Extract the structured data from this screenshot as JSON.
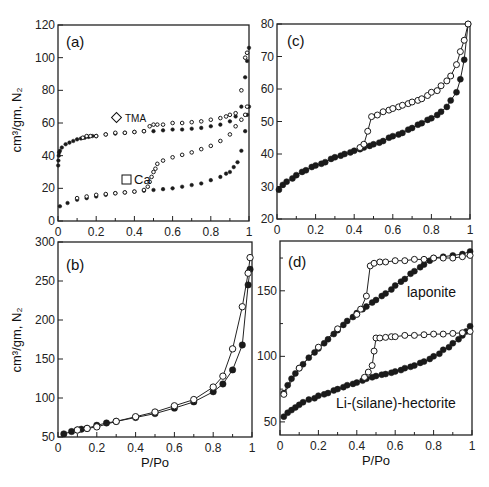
{
  "chart_data": [
    {
      "id": "a",
      "type": "scatter",
      "panel_label": "(a)",
      "xlabel": "",
      "ylabel": "cm3/gm, N2",
      "xlim": [
        0,
        1
      ],
      "ylim": [
        0,
        120
      ],
      "xticks": [
        0,
        0.2,
        0.4,
        0.6,
        0.8,
        1
      ],
      "xtick_labels": [
        "0",
        "0.2",
        "0.4",
        "0.6",
        "0.8",
        "1"
      ],
      "yticks": [
        0,
        20,
        40,
        60,
        80,
        100,
        120
      ],
      "ytick_labels": [
        "0",
        "20",
        "40",
        "60",
        "80",
        "100",
        "120"
      ],
      "annotations": [
        {
          "text": "TMA",
          "marker": "diamond",
          "x": 0.32,
          "y": 62
        },
        {
          "text": "Ca",
          "marker": "square",
          "x": 0.38,
          "y": 24
        }
      ],
      "series": [
        {
          "name": "TMA adsorption",
          "marker": "filled",
          "lines": false,
          "x": [
            0.001,
            0.002,
            0.004,
            0.006,
            0.01,
            0.02,
            0.04,
            0.06,
            0.08,
            0.1,
            0.12,
            0.14,
            0.16,
            0.18,
            0.2,
            0.25,
            0.3,
            0.35,
            0.4,
            0.45,
            0.5,
            0.55,
            0.6,
            0.65,
            0.7,
            0.75,
            0.8,
            0.85,
            0.9,
            0.93,
            0.96,
            0.98,
            0.99,
            1.0
          ],
          "y": [
            34,
            37,
            40,
            42,
            43,
            45,
            47,
            48,
            49,
            50,
            50.5,
            51,
            51.5,
            52,
            52,
            53,
            53.5,
            54,
            54.5,
            55,
            55,
            55.5,
            56,
            56,
            56.5,
            57,
            58,
            59,
            61,
            64,
            70,
            88,
            98,
            106
          ]
        },
        {
          "name": "TMA desorption",
          "marker": "open",
          "lines": false,
          "x": [
            0.13,
            0.15,
            0.17,
            0.2,
            0.25,
            0.3,
            0.35,
            0.4,
            0.45,
            0.48,
            0.5,
            0.52,
            0.55,
            0.6,
            0.65,
            0.7,
            0.75,
            0.8,
            0.85,
            0.88,
            0.9,
            0.93,
            0.96,
            0.98,
            0.99
          ],
          "y": [
            51,
            52,
            52,
            52,
            53,
            54,
            54,
            54.5,
            55,
            58,
            59,
            59,
            59,
            60,
            60,
            60.5,
            61,
            62,
            63,
            64,
            65,
            66,
            80,
            100,
            103
          ]
        },
        {
          "name": "Ca adsorption",
          "marker": "filled",
          "lines": false,
          "x": [
            0.01,
            0.05,
            0.1,
            0.15,
            0.2,
            0.25,
            0.3,
            0.35,
            0.4,
            0.45,
            0.5,
            0.55,
            0.6,
            0.65,
            0.7,
            0.75,
            0.8,
            0.85,
            0.88,
            0.9,
            0.92,
            0.94,
            0.96,
            0.98,
            0.99,
            1.0
          ],
          "y": [
            9,
            11,
            13,
            14,
            15,
            16,
            17,
            17.5,
            18,
            18.5,
            19,
            19.5,
            20,
            21,
            22,
            23,
            25,
            27,
            29,
            30,
            33,
            36,
            43,
            55,
            65,
            70
          ]
        },
        {
          "name": "Ca desorption",
          "marker": "open",
          "lines": false,
          "x": [
            0.1,
            0.15,
            0.2,
            0.25,
            0.3,
            0.35,
            0.4,
            0.45,
            0.47,
            0.48,
            0.49,
            0.5,
            0.51,
            0.52,
            0.55,
            0.6,
            0.65,
            0.7,
            0.75,
            0.8,
            0.85,
            0.9,
            0.93,
            0.96,
            0.98,
            0.99
          ],
          "y": [
            14,
            15,
            16,
            16.5,
            17,
            17.5,
            18,
            19,
            21,
            24,
            27,
            30,
            32,
            35,
            37,
            39,
            40.5,
            42,
            44,
            46,
            49,
            53,
            58,
            62,
            65,
            70
          ]
        }
      ]
    },
    {
      "id": "c",
      "type": "line",
      "panel_label": "(c)",
      "xlabel": "",
      "ylabel": "",
      "xlim": [
        0,
        1
      ],
      "ylim": [
        20,
        80
      ],
      "xticks": [
        0,
        0.2,
        0.4,
        0.6,
        0.8,
        1
      ],
      "xtick_labels": [
        "0",
        "0.2",
        "0.4",
        "0.6",
        "0.8",
        "1"
      ],
      "yticks": [
        20,
        30,
        40,
        50,
        60,
        70,
        80
      ],
      "ytick_labels": [
        "20",
        "30",
        "40",
        "50",
        "60",
        "70",
        "80"
      ],
      "series": [
        {
          "name": "adsorption",
          "marker": "filled",
          "lines": true,
          "x": [
            0.01,
            0.03,
            0.05,
            0.08,
            0.1,
            0.13,
            0.15,
            0.18,
            0.2,
            0.23,
            0.25,
            0.28,
            0.3,
            0.33,
            0.35,
            0.38,
            0.4,
            0.43,
            0.45,
            0.48,
            0.5,
            0.53,
            0.55,
            0.58,
            0.6,
            0.63,
            0.65,
            0.68,
            0.7,
            0.73,
            0.75,
            0.78,
            0.8,
            0.83,
            0.85,
            0.88,
            0.9,
            0.93,
            0.95,
            0.97,
            0.99
          ],
          "y": [
            29,
            30.5,
            31.5,
            32.5,
            33.5,
            34.5,
            35,
            36,
            36.5,
            37,
            37.5,
            38.5,
            39,
            39.5,
            40,
            40.5,
            41,
            41.5,
            42,
            42.5,
            43,
            43.5,
            44,
            45,
            45.5,
            46,
            46.5,
            47.5,
            48,
            49,
            49.5,
            50.5,
            51,
            52,
            53,
            54.5,
            56.5,
            59,
            63,
            69,
            80
          ]
        },
        {
          "name": "desorption",
          "marker": "open",
          "lines": true,
          "x": [
            0.43,
            0.45,
            0.47,
            0.49,
            0.52,
            0.55,
            0.58,
            0.6,
            0.63,
            0.65,
            0.68,
            0.7,
            0.73,
            0.75,
            0.78,
            0.8,
            0.83,
            0.85,
            0.88,
            0.9,
            0.93,
            0.95,
            0.97,
            0.99
          ],
          "y": [
            42,
            43,
            47,
            51.5,
            52,
            53,
            53.5,
            54,
            54.5,
            55,
            55.5,
            56,
            56.5,
            57,
            58,
            59,
            59.5,
            61,
            62.5,
            64,
            67.5,
            71.5,
            75,
            80
          ]
        }
      ]
    },
    {
      "id": "b",
      "type": "line",
      "panel_label": "(b)",
      "xlabel": "P/Po",
      "ylabel": "cm3/gm, N2",
      "xlim": [
        0,
        1
      ],
      "ylim": [
        50,
        300
      ],
      "xticks": [
        0,
        0.2,
        0.4,
        0.6,
        0.8,
        1
      ],
      "xtick_labels": [
        "0",
        "0.2",
        "0.4",
        "0.6",
        "0.8",
        "1"
      ],
      "yticks": [
        50,
        100,
        150,
        200,
        250,
        300
      ],
      "ytick_labels": [
        "50",
        "100",
        "150",
        "200",
        "250",
        "300"
      ],
      "series": [
        {
          "name": "adsorption",
          "marker": "filled",
          "lines": true,
          "x": [
            0.03,
            0.07,
            0.1,
            0.12,
            0.15,
            0.2,
            0.25,
            0.3,
            0.4,
            0.5,
            0.6,
            0.7,
            0.8,
            0.85,
            0.9,
            0.95,
            0.98,
            0.99
          ],
          "y": [
            54,
            57,
            59,
            60,
            61,
            65,
            68,
            70,
            75,
            80,
            87,
            95,
            108,
            118,
            136,
            168,
            245,
            265
          ]
        },
        {
          "name": "desorption",
          "marker": "open",
          "lines": true,
          "x": [
            0.1,
            0.15,
            0.2,
            0.3,
            0.4,
            0.5,
            0.6,
            0.7,
            0.8,
            0.85,
            0.9,
            0.95,
            0.98,
            0.99
          ],
          "y": [
            59,
            61,
            63,
            70,
            76,
            82,
            90,
            98,
            114,
            128,
            163,
            217,
            260,
            280
          ]
        }
      ]
    },
    {
      "id": "d",
      "type": "line",
      "panel_label": "(d)",
      "xlabel": "P/Po",
      "ylabel": "",
      "xlim": [
        0,
        1
      ],
      "ylim": [
        40,
        188
      ],
      "xticks": [
        0,
        0.2,
        0.4,
        0.6,
        0.8,
        1
      ],
      "xtick_labels": [
        "0",
        "0.2",
        "0.4",
        "0.6",
        "0.8",
        "1"
      ],
      "yticks": [
        50,
        100,
        150
      ],
      "ytick_labels": [
        "50",
        "100",
        "150"
      ],
      "annotations": [
        {
          "text": "laponite",
          "x": 0.66,
          "y": 150
        },
        {
          "text": "Li-(silane)-hectorite",
          "x": 0.29,
          "y": 64
        }
      ],
      "series": [
        {
          "name": "laponite adsorption",
          "marker": "filled",
          "lines": true,
          "x": [
            0.02,
            0.04,
            0.06,
            0.08,
            0.1,
            0.12,
            0.15,
            0.18,
            0.2,
            0.23,
            0.25,
            0.28,
            0.3,
            0.33,
            0.35,
            0.38,
            0.4,
            0.43,
            0.45,
            0.48,
            0.5,
            0.53,
            0.55,
            0.58,
            0.6,
            0.63,
            0.65,
            0.68,
            0.7,
            0.73,
            0.75,
            0.78,
            0.8,
            0.85,
            0.9,
            0.95,
            0.99
          ],
          "y": [
            72,
            78,
            83,
            87,
            91,
            94,
            99,
            103,
            106,
            110,
            113,
            117,
            120,
            124,
            127,
            130,
            133,
            136,
            138,
            141,
            143,
            146,
            148,
            151,
            154,
            157,
            159,
            163,
            165,
            168,
            170,
            173,
            175,
            176,
            177,
            178,
            180
          ]
        },
        {
          "name": "laponite desorption",
          "marker": "open",
          "lines": true,
          "x": [
            0.02,
            0.1,
            0.2,
            0.3,
            0.4,
            0.42,
            0.45,
            0.47,
            0.49,
            0.52,
            0.55,
            0.6,
            0.65,
            0.7,
            0.75,
            0.8,
            0.85,
            0.9,
            0.95,
            0.99
          ],
          "y": [
            71,
            91,
            107,
            121,
            132,
            136,
            146,
            169,
            171,
            172,
            172,
            173,
            173,
            174,
            174,
            175,
            175,
            175,
            176,
            177
          ]
        },
        {
          "name": "Li-(silane)-hectorite adsorption",
          "marker": "filled",
          "lines": true,
          "x": [
            0.02,
            0.04,
            0.06,
            0.08,
            0.1,
            0.12,
            0.15,
            0.18,
            0.2,
            0.23,
            0.25,
            0.28,
            0.3,
            0.33,
            0.35,
            0.38,
            0.4,
            0.43,
            0.45,
            0.48,
            0.5,
            0.53,
            0.55,
            0.58,
            0.6,
            0.63,
            0.65,
            0.68,
            0.7,
            0.73,
            0.75,
            0.78,
            0.8,
            0.83,
            0.85,
            0.88,
            0.9,
            0.93,
            0.95,
            0.97,
            0.99
          ],
          "y": [
            54,
            57,
            59,
            61,
            63,
            65,
            67,
            68,
            70,
            71,
            72,
            74,
            75,
            76.5,
            78,
            79,
            80,
            81.5,
            83,
            84,
            85,
            86,
            86.5,
            87.5,
            88.5,
            89.5,
            91,
            92,
            93,
            95,
            96,
            98,
            100,
            102,
            105,
            107,
            110,
            113,
            116,
            119,
            123
          ]
        },
        {
          "name": "Li-(silane)-hectorite desorption",
          "marker": "open",
          "lines": true,
          "x": [
            0.44,
            0.46,
            0.48,
            0.49,
            0.5,
            0.52,
            0.55,
            0.58,
            0.6,
            0.65,
            0.7,
            0.75,
            0.8,
            0.85,
            0.9,
            0.95,
            0.99
          ],
          "y": [
            84,
            88,
            93,
            104,
            114,
            114,
            114.5,
            115,
            115,
            116,
            116,
            116.5,
            117,
            117,
            117.5,
            118,
            119
          ]
        }
      ]
    }
  ],
  "panels": {
    "a": {
      "label": "(a)",
      "legend_tma": "TMA",
      "legend_ca": "Ca"
    },
    "b": {
      "label": "(b)",
      "xlabel": "P/Po"
    },
    "c": {
      "label": "(c)"
    },
    "d": {
      "label": "(d)",
      "xlabel": "P/Po",
      "laponite": "laponite",
      "hectorite": "Li-(silane)-hectorite"
    },
    "ylabel_top": "cm³/gm, N₂",
    "ylabel_bottom": "cm³/gm, N₂"
  }
}
